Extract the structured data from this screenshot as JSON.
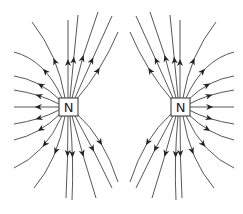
{
  "diagram": {
    "title": "",
    "poles": [
      {
        "id": "left",
        "label": "N",
        "cx": 68,
        "cy": 107
      },
      {
        "id": "right",
        "label": "N",
        "cx": 180,
        "cy": 107
      }
    ],
    "colors": {
      "line": "#444444",
      "box": "#333333",
      "background": "#ffffff"
    }
  }
}
